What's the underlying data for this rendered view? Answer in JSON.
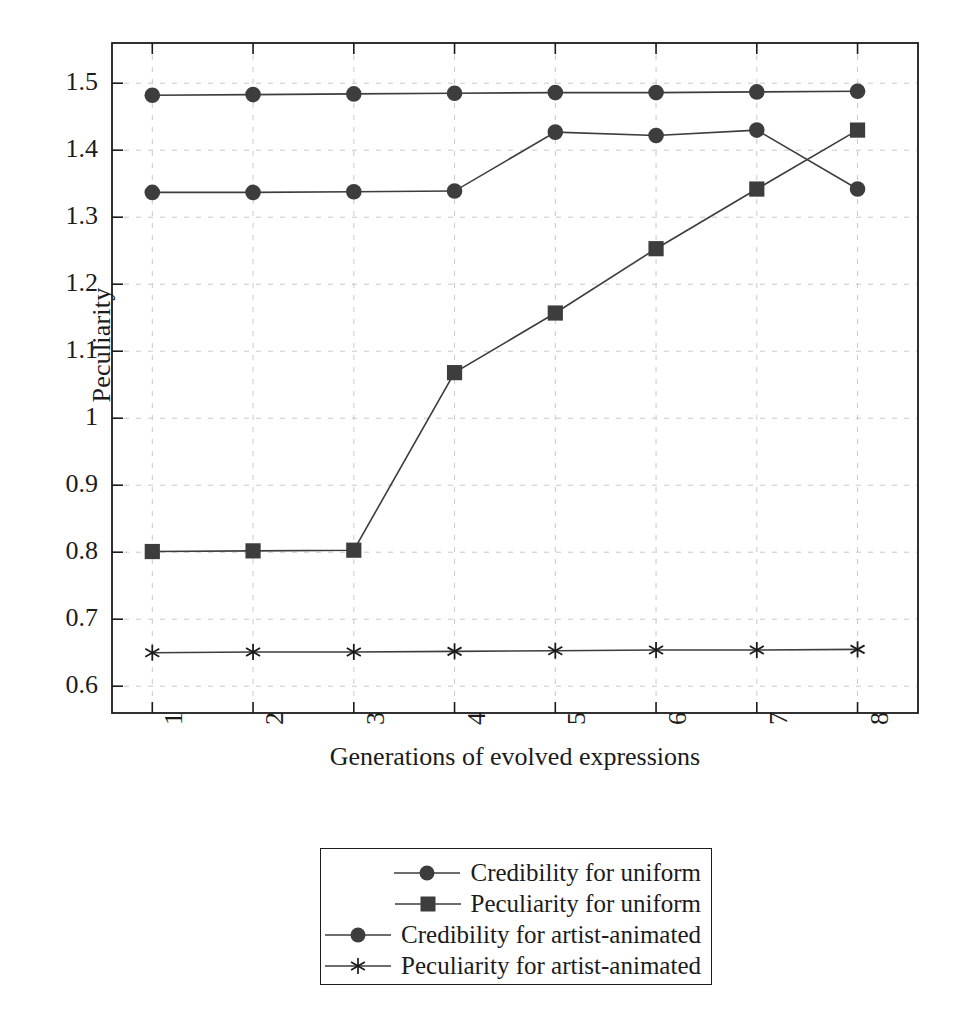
{
  "chart_data": {
    "type": "line",
    "title": "",
    "xlabel": "Generations of evolved expressions",
    "ylabel": "Peculiarity",
    "x": [
      1,
      2,
      3,
      4,
      5,
      6,
      7,
      8
    ],
    "xticklabels": [
      "1",
      "2",
      "3",
      "4",
      "5",
      "6",
      "7",
      "8"
    ],
    "yticklabels": [
      "0.6",
      "0.7",
      "0.8",
      "0.9",
      "1",
      "1.1",
      "1.2",
      "1.3",
      "1.4",
      "1.5"
    ],
    "yticks": [
      0.6,
      0.7,
      0.8,
      0.9,
      1.0,
      1.1,
      1.2,
      1.3,
      1.4,
      1.5
    ],
    "xlim": [
      0.6,
      8.6
    ],
    "ylim": [
      0.56,
      1.56
    ],
    "grid": true,
    "legend_position": "below-center",
    "series": [
      {
        "name": "Credibility for uniform",
        "marker": "circle",
        "color": "#3d3d3d",
        "values": [
          1.337,
          1.337,
          1.338,
          1.339,
          1.427,
          1.422,
          1.43,
          1.342
        ]
      },
      {
        "name": "Peculiarity for uniform",
        "marker": "square",
        "color": "#3d3d3d",
        "values": [
          0.801,
          0.802,
          0.803,
          1.068,
          1.157,
          1.253,
          1.342,
          1.43
        ]
      },
      {
        "name": "Credibility for artist-animated",
        "marker": "circle",
        "color": "#3d3d3d",
        "values": [
          1.482,
          1.483,
          1.484,
          1.485,
          1.486,
          1.486,
          1.487,
          1.488
        ]
      },
      {
        "name": "Peculiarity for artist-animated",
        "marker": "star",
        "color": "#3d3d3d",
        "values": [
          0.65,
          0.651,
          0.651,
          0.652,
          0.653,
          0.654,
          0.654,
          0.655
        ]
      }
    ]
  },
  "axis": {
    "frame_color": "#1b1b1b",
    "grid_color": "#c9c9c9"
  }
}
